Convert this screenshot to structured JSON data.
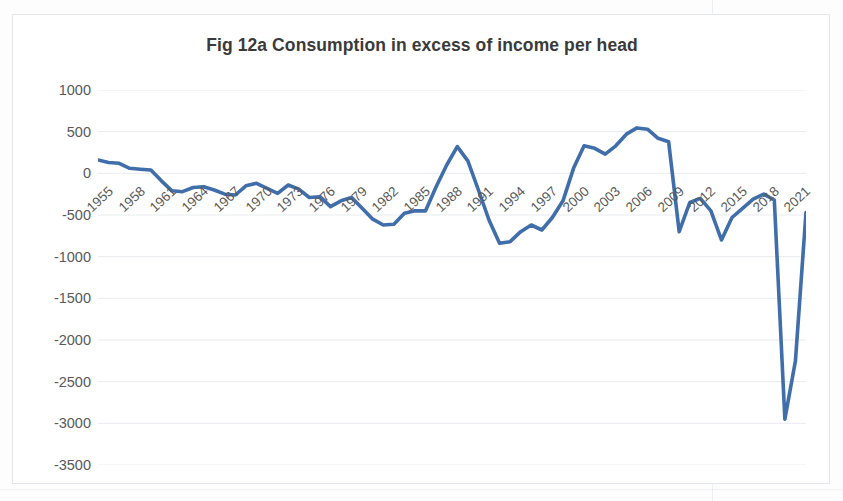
{
  "figure": {
    "title": "Fig 12a Consumption in excess of income per head",
    "line_color": "#3f6eab",
    "gridline_color": "#e8ebef",
    "text_color": "#595959",
    "frame_color": "#e3e6ea"
  },
  "chart_data": {
    "type": "line",
    "title": "Fig 12a Consumption in excess of income per head",
    "xlabel": "",
    "ylabel": "",
    "xlim": [
      1955,
      2022
    ],
    "ylim": [
      -3500,
      1000
    ],
    "ytick_step": 500,
    "grid": true,
    "legend": "none",
    "ytick_labels": [
      "1000",
      "500",
      "0",
      "-500",
      "-1000",
      "-1500",
      "-2000",
      "-2500",
      "-3000",
      "-3500"
    ],
    "ytick_values": [
      1000,
      500,
      0,
      -500,
      -1000,
      -1500,
      -2000,
      -2500,
      -3000,
      -3500
    ],
    "xtick_labels": [
      "1955",
      "1958",
      "1961",
      "1964",
      "1967",
      "1970",
      "1973",
      "1976",
      "1979",
      "1982",
      "1985",
      "1988",
      "1991",
      "1994",
      "1997",
      "2000",
      "2003",
      "2006",
      "2009",
      "2012",
      "2015",
      "2018",
      "2021"
    ],
    "xtick_values": [
      1955,
      1958,
      1961,
      1964,
      1967,
      1970,
      1973,
      1976,
      1979,
      1982,
      1985,
      1988,
      1991,
      1994,
      1997,
      2000,
      2003,
      2006,
      2009,
      2012,
      2015,
      2018,
      2021
    ],
    "x": [
      1955,
      1956,
      1957,
      1958,
      1959,
      1960,
      1961,
      1962,
      1963,
      1964,
      1965,
      1966,
      1967,
      1968,
      1969,
      1970,
      1971,
      1972,
      1973,
      1974,
      1975,
      1976,
      1977,
      1978,
      1979,
      1980,
      1981,
      1982,
      1983,
      1984,
      1985,
      1986,
      1987,
      1988,
      1989,
      1990,
      1991,
      1992,
      1993,
      1994,
      1995,
      1996,
      1997,
      1998,
      1999,
      2000,
      2001,
      2002,
      2003,
      2004,
      2005,
      2006,
      2007,
      2008,
      2009,
      2010,
      2011,
      2012,
      2013,
      2014,
      2015,
      2016,
      2017,
      2018,
      2019,
      2020,
      2021,
      2022
    ],
    "y": [
      160,
      130,
      120,
      60,
      50,
      40,
      -90,
      -210,
      -220,
      -170,
      -160,
      -200,
      -250,
      -260,
      -150,
      -120,
      -180,
      -240,
      -140,
      -190,
      -290,
      -280,
      -400,
      -330,
      -290,
      -420,
      -550,
      -620,
      -610,
      -480,
      -450,
      -450,
      -160,
      100,
      320,
      150,
      -200,
      -560,
      -840,
      -820,
      -700,
      -620,
      -680,
      -530,
      -330,
      60,
      330,
      300,
      230,
      330,
      470,
      545,
      530,
      420,
      380,
      -700,
      -350,
      -300,
      -450,
      -800,
      -530,
      -420,
      -310,
      -250,
      -320,
      -2950,
      -2250,
      -470
    ],
    "series": [
      {
        "name": "Consumption in excess of income per head",
        "color": "#3f6eab",
        "values": [
          160,
          130,
          120,
          60,
          50,
          40,
          -90,
          -210,
          -220,
          -170,
          -160,
          -200,
          -250,
          -260,
          -150,
          -120,
          -180,
          -240,
          -140,
          -190,
          -290,
          -280,
          -400,
          -330,
          -290,
          -420,
          -550,
          -620,
          -610,
          -480,
          -450,
          -450,
          -160,
          100,
          320,
          150,
          -200,
          -560,
          -840,
          -820,
          -700,
          -620,
          -680,
          -530,
          -330,
          60,
          330,
          300,
          230,
          330,
          470,
          545,
          530,
          420,
          380,
          -700,
          -350,
          -300,
          -450,
          -800,
          -530,
          -420,
          -310,
          -250,
          -320,
          -2950,
          -2250,
          -470
        ]
      }
    ],
    "annotations": [
      {
        "label": "peak",
        "x": 2006,
        "y": 545
      },
      {
        "label": "trough",
        "x": 2020,
        "y": -2950
      }
    ]
  }
}
